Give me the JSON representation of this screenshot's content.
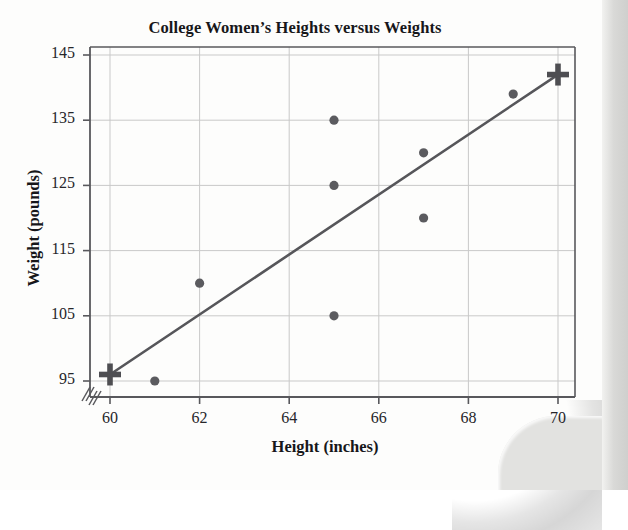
{
  "chart_data": {
    "type": "scatter",
    "title": "College Women’s Heights versus Weights",
    "xlabel": "Height (inches)",
    "ylabel": "Weight (pounds)",
    "xlim": [
      59.55,
      70.4
    ],
    "ylim": [
      92.5,
      146.5
    ],
    "xticks": [
      60,
      62,
      64,
      66,
      68,
      70
    ],
    "yticks": [
      95,
      105,
      115,
      125,
      135,
      145
    ],
    "xtick_labels": [
      "60",
      "62",
      "64",
      "66",
      "68",
      "70"
    ],
    "ytick_labels": [
      "95",
      "105",
      "115",
      "125",
      "135",
      "145"
    ],
    "grid": true,
    "legend": "none",
    "axis_break": true,
    "points": [
      {
        "x": 61,
        "y": 95
      },
      {
        "x": 62,
        "y": 110
      },
      {
        "x": 65,
        "y": 105
      },
      {
        "x": 65,
        "y": 125
      },
      {
        "x": 65,
        "y": 135
      },
      {
        "x": 67,
        "y": 120
      },
      {
        "x": 67,
        "y": 130
      },
      {
        "x": 69,
        "y": 139
      }
    ],
    "cross_markers": [
      {
        "x": 60,
        "y": 96
      },
      {
        "x": 70,
        "y": 142
      }
    ],
    "line": {
      "x1": 60,
      "y1": 96,
      "x2": 70,
      "y2": 142
    },
    "colors": {
      "point": "#5b5b5f",
      "line": "#56565a",
      "cross": "#4e4e52",
      "grid": "#c9c9c9",
      "axis": "#58585c",
      "text": "#17171a"
    }
  }
}
